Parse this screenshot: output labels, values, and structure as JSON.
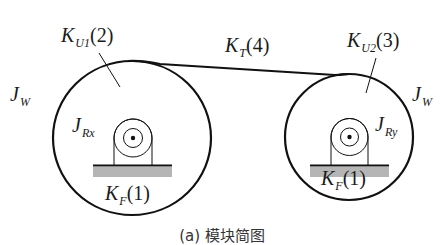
{
  "diagram": {
    "type": "mechanical-model",
    "colors": {
      "stroke": "#111111",
      "ground_fill": "#b5b5b5",
      "text": "#1a1a1a",
      "background": "#ffffff"
    },
    "left_wheel": {
      "inertia_label": {
        "main": "J",
        "sub": "W"
      },
      "stiffness_label": {
        "main": "K",
        "sub": "U1",
        "index": "(2)"
      },
      "roller_label": {
        "main": "J",
        "sub": "Rx"
      },
      "foundation_label": {
        "main": "K",
        "sub": "F",
        "index": "(1)"
      }
    },
    "right_wheel": {
      "inertia_label": {
        "main": "J",
        "sub": "W"
      },
      "stiffness_label": {
        "main": "K",
        "sub": "U2",
        "index": "(3)"
      },
      "roller_label": {
        "main": "J",
        "sub": "Ry"
      },
      "foundation_label": {
        "main": "K",
        "sub": "F",
        "index": "(1)"
      }
    },
    "belt_label": {
      "main": "K",
      "sub": "T",
      "index": "(4)"
    },
    "caption": "(a) 模块简图"
  }
}
